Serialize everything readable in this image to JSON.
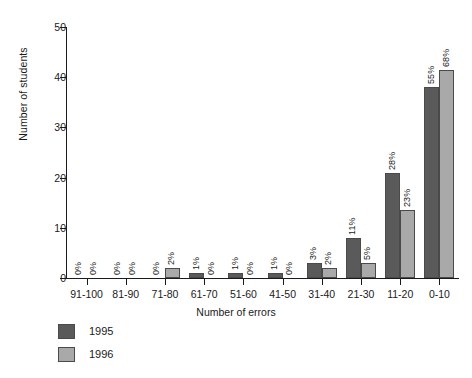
{
  "chart_data": {
    "type": "bar",
    "title": "",
    "subtitle": "",
    "xlabel": "Number of errors",
    "ylabel": "Number of students",
    "categories": [
      "91-100",
      "81-90",
      "71-80",
      "61-70",
      "51-60",
      "41-50",
      "31-40",
      "21-30",
      "11-20",
      "0-10"
    ],
    "ylim": [
      0,
      50
    ],
    "yticks": [
      0,
      10,
      20,
      30,
      40,
      50
    ],
    "grid": false,
    "legend_position": "bottom-left",
    "series": [
      {
        "name": "1995",
        "color": "#5a5a5a",
        "values": [
          0,
          0,
          0,
          1,
          1,
          1,
          3,
          8,
          21,
          38
        ],
        "labels": [
          "0%",
          "0%",
          "0%",
          "1%",
          "1%",
          "1%",
          "3%",
          "11%",
          "28%",
          "55%"
        ]
      },
      {
        "name": "1996",
        "color": "#a9a9a9",
        "values": [
          0,
          0,
          2,
          0,
          0,
          0,
          2,
          3,
          13.5,
          41.5
        ],
        "labels": [
          "0%",
          "0%",
          "2%",
          "0%",
          "0%",
          "0%",
          "2%",
          "5%",
          "23%",
          "68%"
        ]
      }
    ]
  },
  "legend": {
    "items": [
      {
        "label": "1995",
        "color": "#5a5a5a"
      },
      {
        "label": "1996",
        "color": "#a9a9a9"
      }
    ]
  }
}
